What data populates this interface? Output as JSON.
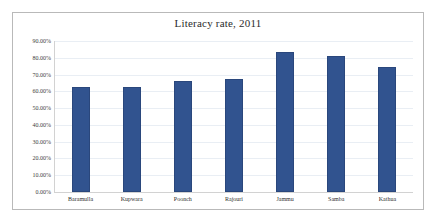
{
  "chart_data": {
    "type": "bar",
    "title": "Literacy rate, 2011",
    "xlabel": "",
    "ylabel": "",
    "categories": [
      "Baramulla",
      "Kupwara",
      "Poonch",
      "Rajouri",
      "Jammu",
      "Samba",
      "Kathua"
    ],
    "values": [
      62.4,
      62.7,
      66.3,
      67.1,
      83.2,
      81.0,
      74.7
    ],
    "value_labels": [
      "62.40%",
      "62.70%",
      "66.30%",
      "67.10%",
      "83.20%",
      "81.00%",
      "74.70%"
    ],
    "series": [
      {
        "name": "Literacy rate, 2011",
        "values": [
          62.4,
          62.7,
          66.3,
          67.1,
          83.2,
          81.0,
          74.7
        ]
      }
    ],
    "ylim": [
      0,
      90
    ],
    "ytick_values": [
      0,
      10,
      20,
      30,
      40,
      50,
      60,
      70,
      80,
      90
    ],
    "ytick_labels": [
      "0.00%",
      "10.00%",
      "20.00%",
      "30.00%",
      "40.00%",
      "50.00%",
      "60.00%",
      "70.00%",
      "80.00%",
      "90.00%"
    ],
    "grid": true,
    "legend": false,
    "legend_position": "none",
    "bar_color": "#31538f",
    "bar_border_color": "#2a477c",
    "gridline_color": "#e9eef4",
    "axis_color": "#d2d2d2",
    "frame_border_color": "#b9b9b9",
    "background_color": "#ffffff"
  }
}
